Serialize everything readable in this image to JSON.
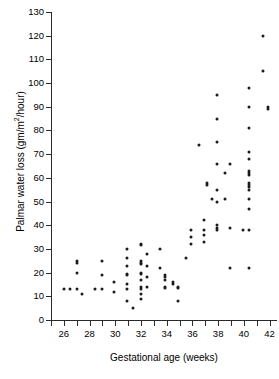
{
  "chart_data": {
    "type": "scatter",
    "title": "",
    "xlabel": "Gestational age (weeks)",
    "ylabel": "Palmar water loss (gm/m²/hour)",
    "ylabel_main": "Palmar water loss (gm/m",
    "ylabel_sup": "2",
    "ylabel_tail": "/hour)",
    "xlim": [
      25,
      42.5
    ],
    "ylim": [
      0,
      130
    ],
    "xticks": [
      26,
      28,
      30,
      32,
      34,
      36,
      38,
      40,
      42
    ],
    "xtick_minor": [
      25,
      27,
      29,
      31,
      33,
      35,
      37,
      39,
      41
    ],
    "yticks": [
      0,
      10,
      20,
      30,
      40,
      50,
      60,
      70,
      80,
      90,
      100,
      110,
      120,
      130
    ],
    "grid": false,
    "legend": null,
    "marker": "filled-circle",
    "marker_color": "#1a1a1a",
    "axis_color": "#2b2b2b",
    "n_points": 96,
    "points": [
      [
        26.0,
        13
      ],
      [
        26.5,
        13
      ],
      [
        27.0,
        25
      ],
      [
        27.0,
        24
      ],
      [
        27.0,
        20
      ],
      [
        27.0,
        13
      ],
      [
        27.4,
        11
      ],
      [
        28.4,
        13
      ],
      [
        29.0,
        25
      ],
      [
        29.0,
        19
      ],
      [
        29.0,
        13
      ],
      [
        29.9,
        16
      ],
      [
        29.9,
        12
      ],
      [
        30.9,
        30
      ],
      [
        30.9,
        26
      ],
      [
        30.9,
        23
      ],
      [
        30.9,
        19.5
      ],
      [
        30.9,
        19
      ],
      [
        30.9,
        15
      ],
      [
        30.9,
        13
      ],
      [
        30.9,
        8
      ],
      [
        31.4,
        5
      ],
      [
        32.0,
        32
      ],
      [
        32.0,
        31.5
      ],
      [
        32.0,
        25
      ],
      [
        32.0,
        24
      ],
      [
        32.0,
        23.5
      ],
      [
        32.0,
        20
      ],
      [
        32.0,
        19.5
      ],
      [
        32.0,
        17
      ],
      [
        32.0,
        14
      ],
      [
        32.0,
        13
      ],
      [
        32.0,
        11
      ],
      [
        32.0,
        9
      ],
      [
        32.5,
        28
      ],
      [
        32.5,
        23
      ],
      [
        32.5,
        18
      ],
      [
        32.5,
        14
      ],
      [
        33.5,
        30
      ],
      [
        33.5,
        22
      ],
      [
        33.9,
        19
      ],
      [
        33.9,
        18
      ],
      [
        33.9,
        17
      ],
      [
        33.9,
        14
      ],
      [
        33.9,
        13.5
      ],
      [
        34.5,
        16
      ],
      [
        34.5,
        15
      ],
      [
        34.9,
        14
      ],
      [
        34.9,
        13.5
      ],
      [
        34.9,
        8
      ],
      [
        35.5,
        26
      ],
      [
        35.9,
        38
      ],
      [
        35.9,
        35
      ],
      [
        35.9,
        32
      ],
      [
        36.5,
        74
      ],
      [
        36.9,
        42
      ],
      [
        36.9,
        38
      ],
      [
        36.9,
        36
      ],
      [
        36.9,
        33
      ],
      [
        37.1,
        58
      ],
      [
        37.1,
        57
      ],
      [
        37.5,
        51
      ],
      [
        37.9,
        95
      ],
      [
        37.9,
        85
      ],
      [
        37.9,
        75
      ],
      [
        37.9,
        66
      ],
      [
        37.9,
        55
      ],
      [
        37.9,
        50
      ],
      [
        37.9,
        40
      ],
      [
        37.9,
        39
      ],
      [
        37.9,
        38
      ],
      [
        38.5,
        62
      ],
      [
        38.5,
        51
      ],
      [
        38.9,
        66
      ],
      [
        38.9,
        39
      ],
      [
        38.9,
        22
      ],
      [
        39.9,
        38
      ],
      [
        40.4,
        98
      ],
      [
        40.4,
        90
      ],
      [
        40.4,
        81
      ],
      [
        40.4,
        71
      ],
      [
        40.4,
        68
      ],
      [
        40.4,
        63
      ],
      [
        40.4,
        62
      ],
      [
        40.4,
        61
      ],
      [
        40.4,
        58
      ],
      [
        40.4,
        57
      ],
      [
        40.4,
        56
      ],
      [
        40.4,
        55
      ],
      [
        40.4,
        51
      ],
      [
        40.4,
        47
      ],
      [
        40.4,
        38
      ],
      [
        40.4,
        22
      ],
      [
        41.5,
        120
      ],
      [
        41.5,
        105
      ],
      [
        41.9,
        90
      ],
      [
        41.9,
        89
      ]
    ]
  },
  "axis_labels": {
    "y": [
      "130",
      "120",
      "110",
      "100",
      "90",
      "80",
      "70",
      "60",
      "50",
      "40",
      "30",
      "20",
      "10",
      "0"
    ],
    "x": [
      "26",
      "28",
      "30",
      "32",
      "34",
      "36",
      "38",
      "40",
      "42"
    ]
  }
}
